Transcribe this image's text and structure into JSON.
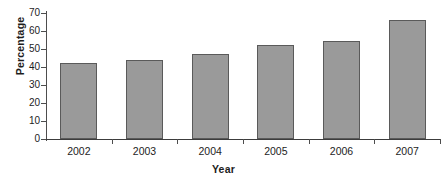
{
  "chart_data": {
    "type": "bar",
    "title": "",
    "xlabel": "Year",
    "ylabel": "Percentage",
    "categories": [
      "2002",
      "2003",
      "2004",
      "2005",
      "2006",
      "2007"
    ],
    "values": [
      42.5,
      44,
      47,
      52,
      54.5,
      66
    ],
    "ylim": [
      0,
      70
    ],
    "ytick_labels": [
      "0",
      "10",
      "20",
      "30",
      "40",
      "50",
      "60",
      "70"
    ],
    "ytick_values": [
      0,
      10,
      20,
      30,
      40,
      50,
      60,
      70
    ],
    "grid": false,
    "legend": "none",
    "series": [
      {
        "name": "Percentage",
        "values": [
          42.5,
          44,
          47,
          52,
          54.5,
          66
        ]
      }
    ],
    "colors": {
      "bar_fill": "#9a9a9a",
      "bar_border": "#5a5a5a",
      "axis": "#4d4d4d",
      "text": "#1d1d1d",
      "background": "#ffffff"
    }
  }
}
